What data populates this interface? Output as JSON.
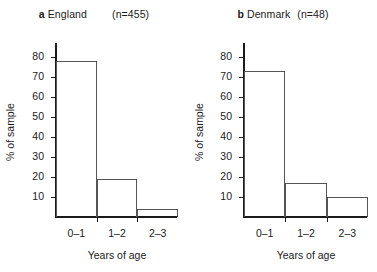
{
  "figure": {
    "background_color": "#ffffff",
    "text_color": "#1a1a1a",
    "axis_color": "#1a1a1a",
    "bar_outline_color": "#555555"
  },
  "chart_data": [
    {
      "type": "bar",
      "panel_tag": "a",
      "title": "England",
      "sample_note": "(n=455)",
      "categories": [
        "0–1",
        "1–2",
        "2–3"
      ],
      "values": [
        78,
        19,
        4
      ],
      "xlabel": "Years of age",
      "ylabel": "% of sample",
      "ylim": [
        0,
        85
      ],
      "yticks": [
        10,
        20,
        30,
        40,
        50,
        60,
        70,
        80
      ],
      "ytick_labels": [
        "10",
        "20",
        "30",
        "40",
        "50",
        "60",
        "70",
        "80"
      ],
      "grid": false,
      "legend": "none"
    },
    {
      "type": "bar",
      "panel_tag": "b",
      "title": "Denmark",
      "sample_note": "(n=48)",
      "categories": [
        "0–1",
        "1–2",
        "2–3"
      ],
      "values": [
        73,
        17,
        10
      ],
      "xlabel": "Years of age",
      "ylabel": "% of sample",
      "ylim": [
        0,
        85
      ],
      "yticks": [
        10,
        20,
        30,
        40,
        50,
        60,
        70,
        80
      ],
      "ytick_labels": [
        "10",
        "20",
        "30",
        "40",
        "50",
        "60",
        "70",
        "80"
      ],
      "grid": false,
      "legend": "none"
    }
  ]
}
